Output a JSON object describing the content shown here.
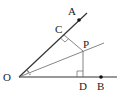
{
  "diagram": {
    "points": {
      "O": {
        "label": "O",
        "x": 19,
        "y": 77,
        "lx": 3,
        "ly": 81
      },
      "A": {
        "label": "A",
        "x": 79,
        "y": 20,
        "lx": 68,
        "ly": 15
      },
      "B": {
        "label": "B",
        "x": 101,
        "y": 77,
        "lx": 97,
        "ly": 90
      },
      "C": {
        "label": "C",
        "x": 64,
        "y": 35,
        "lx": 55,
        "ly": 33
      },
      "D": {
        "label": "D",
        "x": 83,
        "y": 77,
        "lx": 79,
        "ly": 90
      },
      "P": {
        "label": "P",
        "x": 83,
        "y": 51,
        "lx": 83,
        "ly": 48
      }
    },
    "colors": {
      "line": "#333333",
      "thin": "#666666"
    }
  }
}
